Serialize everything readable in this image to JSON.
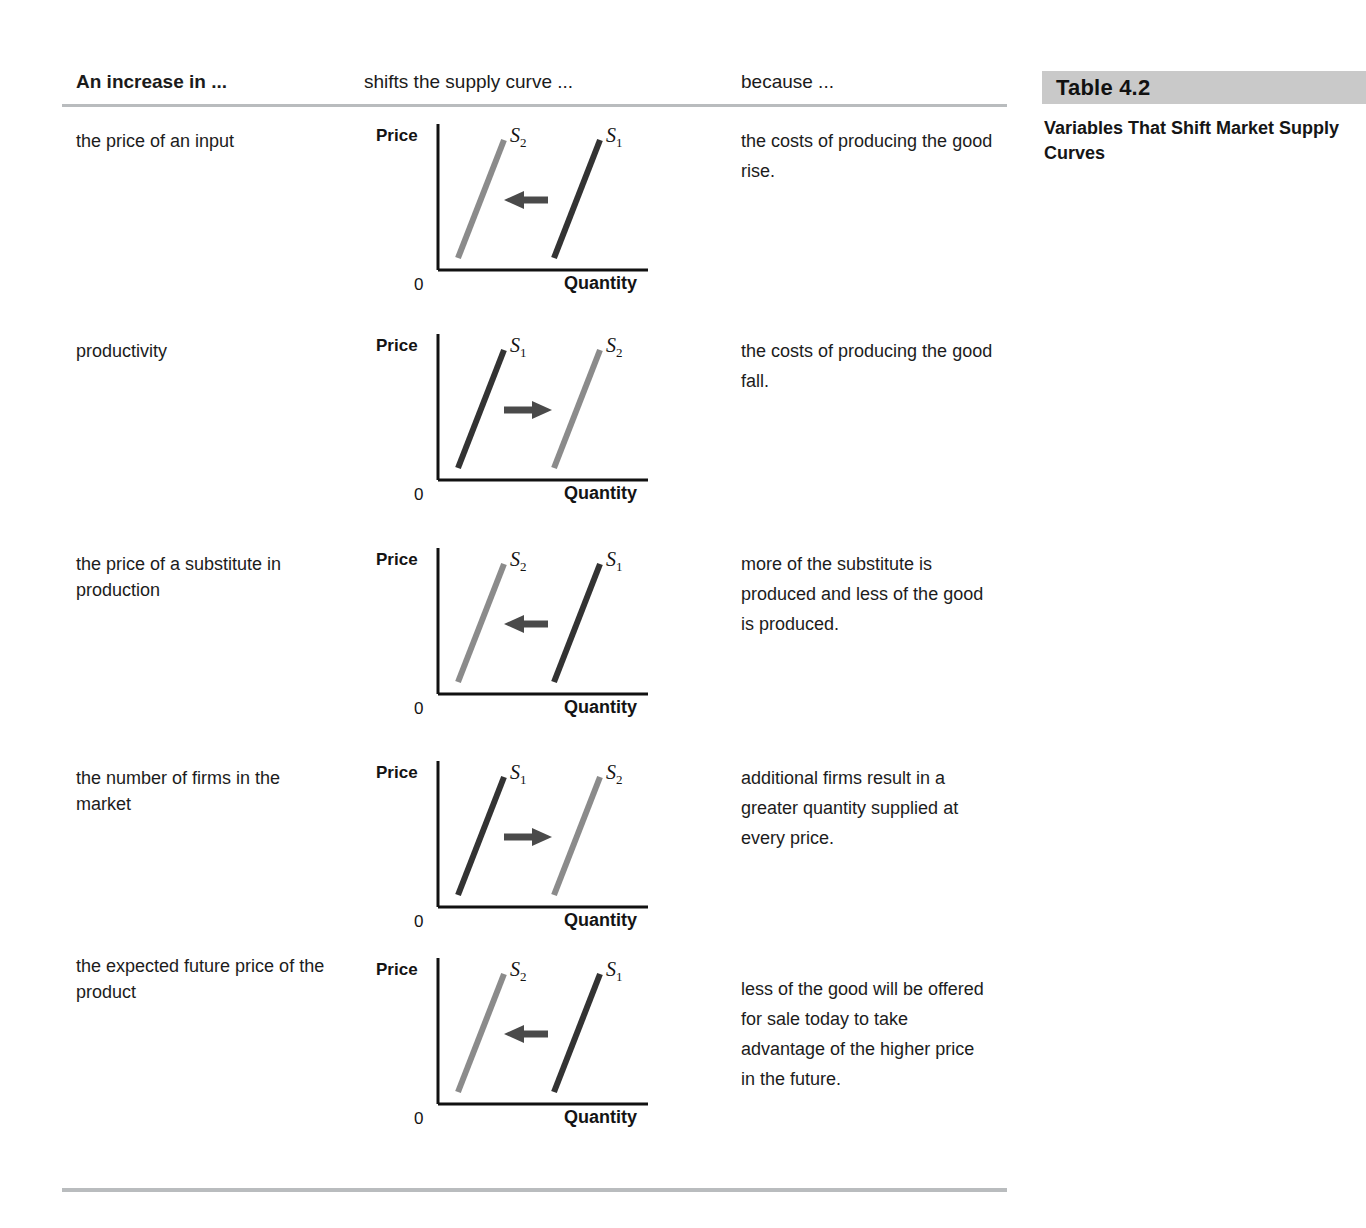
{
  "caption": {
    "band_label": "Table 4.2",
    "title": "Variables That Shift Market Supply Curves"
  },
  "colors": {
    "band": "#c9c9c9",
    "rule": "#b9bcbe",
    "curve_dark": "#333333",
    "curve_grey": "#8b8b8b",
    "axis": "#111111",
    "arrow": "#4a4a4a"
  },
  "columns": {
    "cause": "An increase in ...",
    "shift": "shifts the supply curve ...",
    "because": "because ..."
  },
  "diagram_labels": {
    "price": "Price",
    "quantity": "Quantity",
    "origin": "0",
    "s1": "S",
    "s1_sub": "1",
    "s2": "S",
    "s2_sub": "2"
  },
  "rows": [
    {
      "cause": "the price of an input",
      "because": "the costs of producing the good rise.",
      "direction": "left",
      "left_curve": "S2",
      "right_curve": "S1",
      "left_color": "#8b8b8b",
      "right_color": "#333333"
    },
    {
      "cause": "productivity",
      "because": "the costs of producing the good fall.",
      "direction": "right",
      "left_curve": "S1",
      "right_curve": "S2",
      "left_color": "#333333",
      "right_color": "#8b8b8b"
    },
    {
      "cause": "the price of a substitute in production",
      "because": "more of the substitute is produced and less of the good is produced.",
      "direction": "left",
      "left_curve": "S2",
      "right_curve": "S1",
      "left_color": "#8b8b8b",
      "right_color": "#333333"
    },
    {
      "cause": "the number of firms in the market",
      "because": "additional firms result in a greater quantity supplied at every price.",
      "direction": "right",
      "left_curve": "S1",
      "right_curve": "S2",
      "left_color": "#333333",
      "right_color": "#8b8b8b"
    },
    {
      "cause": "the expected future price of the product",
      "because": "less of the good will be offered for sale today to take advantage of the higher price in the future.",
      "direction": "left",
      "left_curve": "S2",
      "right_curve": "S1",
      "left_color": "#8b8b8b",
      "right_color": "#333333"
    }
  ],
  "row_geometry": [
    {
      "top": 118,
      "cause_top": 128,
      "why_top": 126
    },
    {
      "top": 328,
      "cause_top": 338,
      "why_top": 336
    },
    {
      "top": 542,
      "cause_top": 551,
      "why_top": 549
    },
    {
      "top": 755,
      "cause_top": 765,
      "why_top": 763
    },
    {
      "top": 952,
      "cause_top": 953,
      "why_top": 974
    }
  ]
}
